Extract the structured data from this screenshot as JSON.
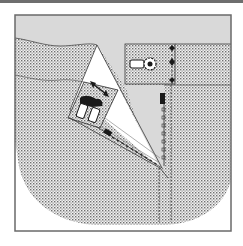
{
  "diagram": {
    "type": "site-plan",
    "colors": {
      "frame": "#6a6a6a",
      "road_gray": "#d9d9d9",
      "stipple_dot": "#6f6f6f",
      "stipple_bg": "#f4f4f4",
      "wedge_white": "#ffffff",
      "ink": "#1a1a1a"
    },
    "elements": [
      {
        "id": "road-band",
        "label": "gray top band (road / open area)"
      },
      {
        "id": "stippled-ground",
        "label": "stippled ground area with rounded bottom-left"
      },
      {
        "id": "white-wedge",
        "label": "white triangular wedge between road and ground"
      },
      {
        "id": "building-block",
        "label": "stippled rectangular plot with vehicle and tree"
      },
      {
        "id": "parking-area",
        "label": "tilted plot with two vehicles and arrows"
      },
      {
        "id": "dashed-path",
        "label": "vertical dashed path with markers"
      }
    ]
  }
}
